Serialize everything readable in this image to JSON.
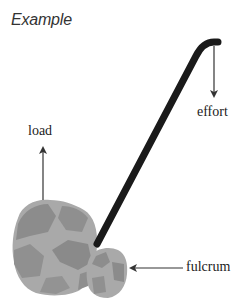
{
  "title": "Example",
  "labels": {
    "load": "load",
    "effort": "effort",
    "fulcrum": "fulcrum"
  },
  "colors": {
    "lever": "#1a1a1a",
    "arrow": "#333333",
    "rock_light": "#a8a8a8",
    "rock_dark": "#8a8a8a",
    "text": "#222222"
  }
}
